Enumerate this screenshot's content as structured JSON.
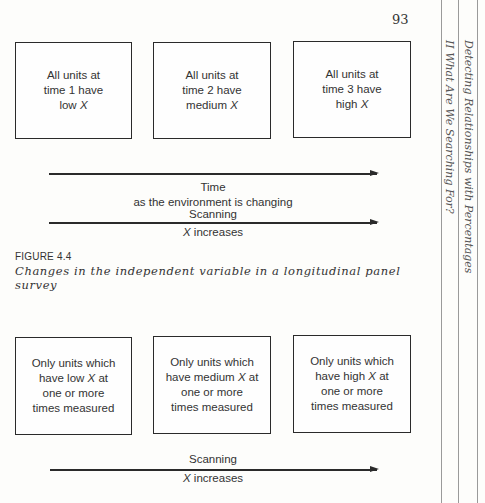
{
  "page": {
    "number": "93",
    "running_heads": {
      "chapter": "Detecting Relationships with Percentages",
      "part": "II What Are We Searching For?"
    }
  },
  "figure_top": {
    "boxes": [
      {
        "lines": [
          "All units at",
          "time 1 have"
        ],
        "last_prefix": "low ",
        "last_var": "X",
        "last_suffix": ""
      },
      {
        "lines": [
          "All units at",
          "time 2 have"
        ],
        "last_prefix": "medium ",
        "last_var": "X",
        "last_suffix": ""
      },
      {
        "lines": [
          "All units at",
          "time 3 have"
        ],
        "last_prefix": "high ",
        "last_var": "X",
        "last_suffix": ""
      }
    ],
    "time_arrow": {
      "label_top": "Time",
      "label_bottom": "as the environment is changing"
    },
    "scan_arrow": {
      "label_top": "Scanning",
      "label_var": "X",
      "label_bottom": " increases"
    },
    "figure_number": "FIGURE 4.4",
    "caption": "Changes in the independent variable in a longitudinal panel survey"
  },
  "figure_bottom": {
    "boxes": [
      {
        "line1": "Only units which",
        "line2_prefix": "have low ",
        "line2_var": "X",
        "line2_suffix": " at",
        "line3": "one or more",
        "line4": "times measured"
      },
      {
        "line1": "Only units which",
        "line2_prefix": "have medium ",
        "line2_var": "X",
        "line2_suffix": " at",
        "line3": "one or more",
        "line4": "times measured"
      },
      {
        "line1": "Only units which",
        "line2_prefix": "have high ",
        "line2_var": "X",
        "line2_suffix": " at",
        "line3": "one or more",
        "line4": "times measured"
      }
    ],
    "scan_arrow": {
      "label_top": "Scanning",
      "label_var": "X",
      "label_bottom": " increases"
    }
  }
}
